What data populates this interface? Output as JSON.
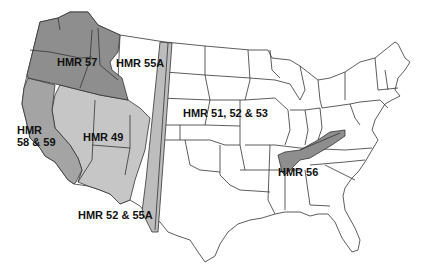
{
  "map": {
    "title": "HMR coverage regions, contiguous United States",
    "regions": [
      {
        "id": "hmr57",
        "label": "HMR 57",
        "shade": "#8e8e8e"
      },
      {
        "id": "hmr55a",
        "label": "HMR 55A",
        "shade": "#ffffff"
      },
      {
        "id": "hmr5859",
        "label_line1": "HMR",
        "label_line2": "58 & 59",
        "shade": "#a4a4a4"
      },
      {
        "id": "hmr49",
        "label": "HMR 49",
        "shade": "#c6c6c6"
      },
      {
        "id": "hmr515253",
        "label": "HMR 51, 52 & 53",
        "shade": "#ffffff"
      },
      {
        "id": "hmr5255a",
        "label": "HMR 52 & 55A",
        "shade": "#bdbdbd"
      },
      {
        "id": "hmr56",
        "label": "HMR 56",
        "shade": "#8e8e8e"
      }
    ]
  }
}
